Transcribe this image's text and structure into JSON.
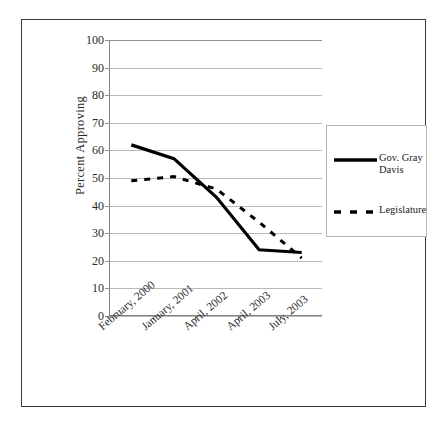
{
  "chart_data": {
    "type": "line",
    "title": "",
    "xlabel": "",
    "ylabel": "Percent Approving",
    "ylim": [
      0,
      100
    ],
    "ytick_step": 10,
    "grid": true,
    "legend_position": "right",
    "categories": [
      "February, 2000",
      "January, 2001",
      "April, 2002",
      "April, 2003",
      "July, 2003"
    ],
    "yticks": [
      "100",
      "90",
      "80",
      "70",
      "60",
      "50",
      "40",
      "30",
      "20",
      "10",
      "0"
    ],
    "series": [
      {
        "name": "Gov. Gray Davis",
        "style": "solid",
        "color": "#000000",
        "values": [
          62,
          57,
          43,
          24,
          23
        ]
      },
      {
        "name": "Legislature",
        "style": "dashed",
        "color": "#000000",
        "values": [
          49,
          50.5,
          46,
          34,
          21
        ]
      }
    ]
  },
  "legend": {
    "entries": [
      {
        "label": "Gov. Gray Davis",
        "style": "solid"
      },
      {
        "label": "Legislature",
        "style": "dashed"
      }
    ]
  },
  "axes": {
    "y_title": "Percent Approving"
  }
}
